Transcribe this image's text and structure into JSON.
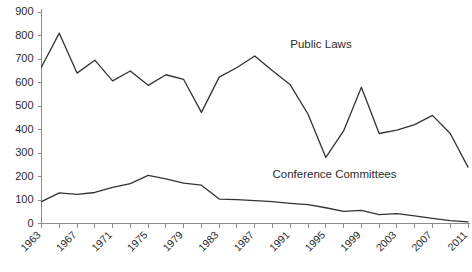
{
  "chart_data": {
    "type": "line",
    "title": "",
    "xlabel": "",
    "ylabel": "",
    "ylim": [
      0,
      900
    ],
    "ytick_step": 100,
    "grid": false,
    "legend_position": "inline-annotation",
    "x": [
      1963,
      1965,
      1967,
      1969,
      1971,
      1973,
      1975,
      1977,
      1979,
      1981,
      1983,
      1985,
      1987,
      1989,
      1991,
      1993,
      1995,
      1997,
      1999,
      2001,
      2003,
      2005,
      2007,
      2009,
      2011
    ],
    "xtick_labels": [
      "1963",
      "1967",
      "1971",
      "1975",
      "1979",
      "1983",
      "1987",
      "1991",
      "1995",
      "1999",
      "2003",
      "2007",
      "2011"
    ],
    "xtick_values": [
      1963,
      1967,
      1971,
      1975,
      1979,
      1983,
      1987,
      1991,
      1995,
      1999,
      2003,
      2007,
      2011
    ],
    "ytick_labels": [
      "0",
      "100",
      "200",
      "300",
      "400",
      "500",
      "600",
      "700",
      "800",
      "900"
    ],
    "ytick_values": [
      0,
      100,
      200,
      300,
      400,
      500,
      600,
      700,
      800,
      900
    ],
    "minor_xticks_every": 2,
    "series": [
      {
        "name": "Public Laws",
        "color": "#333333",
        "values": [
          666,
          810,
          640,
          695,
          607,
          649,
          588,
          633,
          613,
          473,
          623,
          664,
          713,
          650,
          590,
          465,
          281,
          394,
          580,
          383,
          397,
          421,
          460,
          383,
          240
        ],
        "label_x": 1991,
        "label_y": 745
      },
      {
        "name": "Conference Committees",
        "color": "#333333",
        "values": [
          93,
          130,
          124,
          132,
          154,
          170,
          205,
          190,
          172,
          163,
          104,
          102,
          97,
          93,
          86,
          80,
          67,
          52,
          56,
          38,
          42,
          32,
          22,
          12,
          7
        ],
        "label_x": 1989,
        "label_y": 192
      }
    ]
  }
}
